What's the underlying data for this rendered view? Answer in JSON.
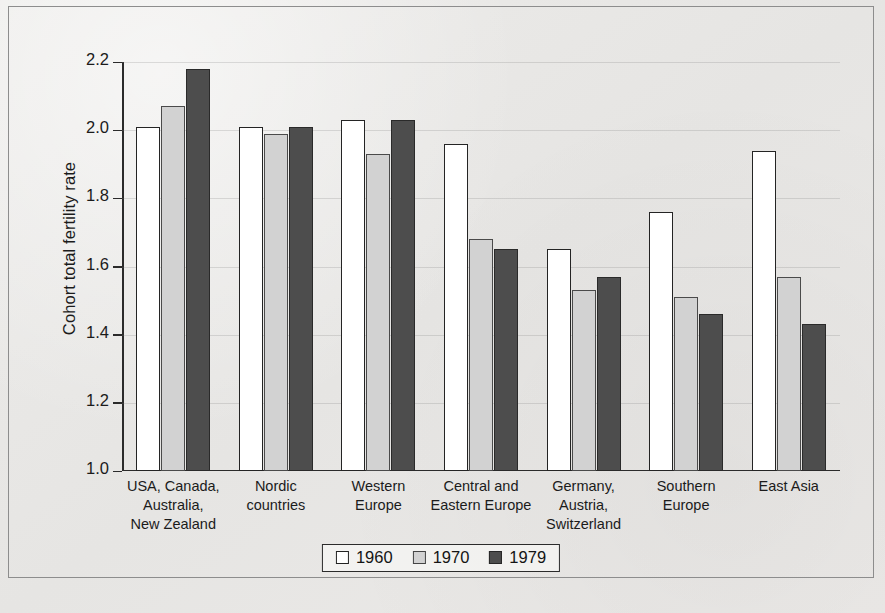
{
  "chart_data": {
    "type": "bar",
    "title": "",
    "xlabel": "",
    "ylabel": "Cohort total fertility rate",
    "ylim": [
      1.0,
      2.2
    ],
    "yticks": [
      "1.0",
      "1.2",
      "1.4",
      "1.6",
      "1.8",
      "2.0",
      "2.2"
    ],
    "grid": "horizontal-faint",
    "legend_position": "bottom-center",
    "categories": [
      "USA, Canada,\nAustralia,\nNew Zealand",
      "Nordic\ncountries",
      "Western\nEurope",
      "Central and\nEastern Europe",
      "Germany,\nAustria,\nSwitzerland",
      "Southern\nEurope",
      "East Asia"
    ],
    "series": [
      {
        "name": "1960",
        "color": "#ffffff",
        "values": [
          2.01,
          2.01,
          2.03,
          1.96,
          1.65,
          1.76,
          1.94
        ]
      },
      {
        "name": "1970",
        "color": "#d2d2d2",
        "values": [
          2.07,
          1.99,
          1.93,
          1.68,
          1.53,
          1.51,
          1.57
        ]
      },
      {
        "name": "1979",
        "color": "#4d4d4d",
        "values": [
          2.18,
          2.01,
          2.03,
          1.65,
          1.57,
          1.46,
          1.43
        ]
      }
    ]
  },
  "legend": {
    "items": [
      {
        "label": "1960"
      },
      {
        "label": "1970"
      },
      {
        "label": "1979"
      }
    ]
  }
}
